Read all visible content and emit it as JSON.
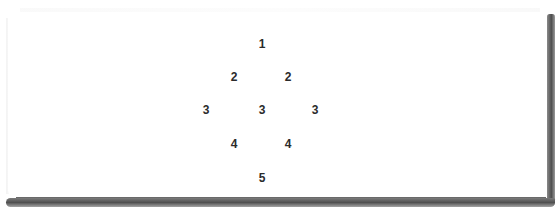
{
  "diagram": {
    "type": "number-diamond",
    "rows": [
      {
        "row": 1,
        "values": [
          "1"
        ]
      },
      {
        "row": 2,
        "values": [
          "2",
          "2"
        ]
      },
      {
        "row": 3,
        "values": [
          "3",
          "3",
          "3"
        ]
      },
      {
        "row": 4,
        "values": [
          "4",
          "4"
        ]
      },
      {
        "row": 5,
        "values": [
          "5"
        ]
      }
    ],
    "cells": [
      {
        "label": "1",
        "x": 262,
        "y": 44
      },
      {
        "label": "2",
        "x": 234,
        "y": 77
      },
      {
        "label": "2",
        "x": 288,
        "y": 77
      },
      {
        "label": "3",
        "x": 206,
        "y": 110
      },
      {
        "label": "3",
        "x": 262,
        "y": 110
      },
      {
        "label": "3",
        "x": 315,
        "y": 110
      },
      {
        "label": "4",
        "x": 234,
        "y": 144
      },
      {
        "label": "4",
        "x": 288,
        "y": 144
      },
      {
        "label": "5",
        "x": 262,
        "y": 178
      }
    ]
  },
  "colors": {
    "background": "#ffffff",
    "text": "#2b2b2b",
    "frame_shadow": "#505050"
  }
}
